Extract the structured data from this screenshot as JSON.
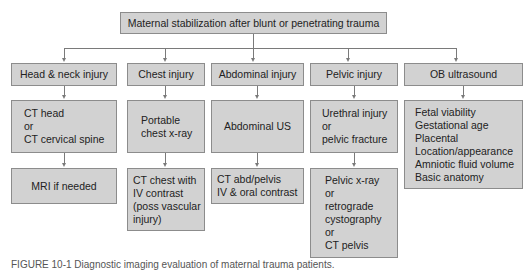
{
  "root": {
    "label": "Maternal stabilization after blunt or penetrating trauma"
  },
  "columns": [
    {
      "category": "Head & neck injury",
      "steps": [
        "CT head\nor\nCT cervical spine",
        "MRI if needed"
      ]
    },
    {
      "category": "Chest injury",
      "steps": [
        "Portable\nchest x-ray",
        "CT chest with\nIV contrast\n(poss vascular\ninjury)"
      ]
    },
    {
      "category": "Abdominal injury",
      "steps": [
        "Abdominal US",
        "CT abd/pelvis\nIV & oral contrast"
      ]
    },
    {
      "category": "Pelvic injury",
      "steps": [
        "Urethral injury\nor\npelvic fracture",
        "Pelvic x-ray\nor\nretrograde\ncystography\nor\nCT pelvis"
      ]
    },
    {
      "category": "OB ultrasound",
      "steps": [
        "Fetal viability\nGestational age\nPlacental\nLocation/appearance\nAmniotic fluid volume\nBasic anatomy"
      ]
    }
  ],
  "caption": "FIGURE 10-1 Diagnostic imaging evaluation of maternal trauma patients."
}
